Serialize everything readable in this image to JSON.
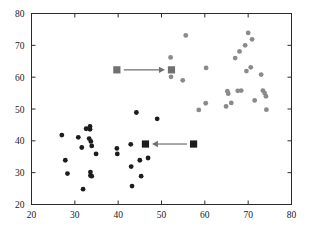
{
  "chart_data": {
    "type": "scatter",
    "title": "",
    "xlabel": "",
    "ylabel": "",
    "xlim": [
      20,
      80
    ],
    "ylim": [
      20,
      80
    ],
    "xticks": [
      20,
      30,
      40,
      50,
      60,
      70,
      80
    ],
    "yticks": [
      20,
      30,
      40,
      50,
      60,
      70,
      80
    ],
    "xticklabels": [
      "20",
      "30",
      "40",
      "50",
      "60",
      "70",
      "80"
    ],
    "yticklabels": [
      "20",
      "30",
      "40",
      "50",
      "60",
      "70",
      "80"
    ],
    "grid": false,
    "legend": null,
    "series": [
      {
        "name": "cluster-dark",
        "marker": "circle",
        "color": "#1c1c1c",
        "points": [
          [
            27.0,
            41.8
          ],
          [
            27.8,
            33.9
          ],
          [
            28.3,
            29.7
          ],
          [
            30.8,
            41.1
          ],
          [
            31.9,
            24.8
          ],
          [
            31.6,
            37.9
          ],
          [
            32.6,
            43.8
          ],
          [
            33.5,
            44.5
          ],
          [
            33.5,
            43.6
          ],
          [
            33.3,
            40.7
          ],
          [
            33.7,
            39.8
          ],
          [
            33.9,
            38.4
          ],
          [
            33.6,
            30.2
          ],
          [
            33.6,
            29.1
          ],
          [
            33.9,
            28.9
          ],
          [
            34.9,
            35.9
          ],
          [
            39.7,
            37.6
          ],
          [
            39.8,
            35.9
          ],
          [
            42.9,
            38.9
          ],
          [
            43.0,
            31.9
          ],
          [
            43.2,
            25.8
          ],
          [
            44.2,
            48.9
          ],
          [
            45.0,
            33.9
          ],
          [
            45.3,
            28.9
          ],
          [
            46.3,
            39.0
          ],
          [
            46.9,
            34.6
          ],
          [
            49.0,
            46.9
          ]
        ]
      },
      {
        "name": "cluster-gray",
        "marker": "circle",
        "color": "#8a8a8a",
        "points": [
          [
            52.1,
            66.2
          ],
          [
            52.2,
            60.1
          ],
          [
            52.3,
            62.3
          ],
          [
            54.9,
            59.0
          ],
          [
            55.6,
            73.1
          ],
          [
            58.6,
            49.7
          ],
          [
            60.3,
            62.9
          ],
          [
            60.2,
            51.8
          ],
          [
            64.9,
            50.8
          ],
          [
            65.2,
            55.6
          ],
          [
            65.4,
            54.8
          ],
          [
            66.1,
            51.9
          ],
          [
            67.0,
            66.0
          ],
          [
            67.6,
            55.7
          ],
          [
            68.0,
            68.1
          ],
          [
            68.4,
            55.8
          ],
          [
            69.3,
            70.0
          ],
          [
            69.6,
            61.9
          ],
          [
            70.0,
            73.9
          ],
          [
            70.6,
            63.1
          ],
          [
            70.9,
            71.9
          ],
          [
            71.5,
            52.7
          ],
          [
            73.0,
            60.8
          ],
          [
            73.4,
            55.8
          ],
          [
            73.8,
            55.0
          ],
          [
            74.1,
            54.0
          ],
          [
            74.2,
            49.8
          ]
        ]
      }
    ],
    "annotations": [
      {
        "name": "gray-square-source",
        "marker": "square",
        "color": "#707070",
        "x": 39.7,
        "y": 62.3,
        "label": ""
      },
      {
        "name": "gray-square-target",
        "marker": "square",
        "color": "#707070",
        "x": 52.3,
        "y": 62.3,
        "label": ""
      },
      {
        "name": "dark-square-target",
        "marker": "square",
        "color": "#1c1c1c",
        "x": 46.3,
        "y": 39.0,
        "label": ""
      },
      {
        "name": "dark-square-source",
        "marker": "square",
        "color": "#1c1c1c",
        "x": 57.4,
        "y": 39.0,
        "label": ""
      }
    ],
    "arrows": [
      {
        "name": "arrow-upper-rightward",
        "from": [
          41.3,
          62.3
        ],
        "to": [
          50.8,
          62.3
        ],
        "color": "#707070",
        "direction": "right"
      },
      {
        "name": "arrow-lower-leftward",
        "from": [
          55.9,
          39.0
        ],
        "to": [
          47.8,
          39.0
        ],
        "color": "#707070",
        "direction": "left"
      }
    ]
  },
  "figure": {
    "background_color": "#ffffff",
    "frame_color": "#2b2b2b",
    "marker_radius_px": 2.4,
    "square_size_px": 7.2
  }
}
